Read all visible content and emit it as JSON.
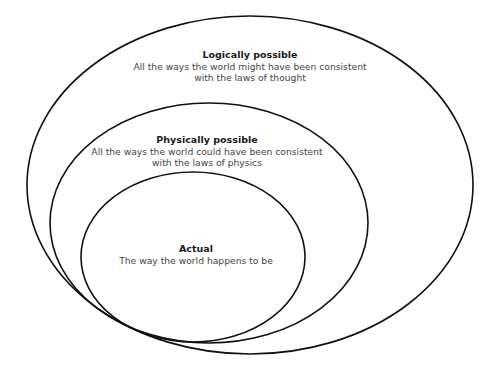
{
  "diagram": {
    "type": "nested-ellipses",
    "sets": [
      {
        "id": "logically-possible",
        "title": "Logically possible",
        "description_lines": [
          "All the ways the world might have been consistent",
          "with the laws of thought"
        ]
      },
      {
        "id": "physically-possible",
        "title": "Physically possible",
        "description_lines": [
          "All the ways the world could have been consistent",
          "with the laws of physics"
        ]
      },
      {
        "id": "actual",
        "title": "Actual",
        "description_lines": [
          "The way the world happens to be"
        ]
      }
    ],
    "colors": {
      "stroke": "#111111",
      "title": "#1a1a1a",
      "text": "#444444",
      "background": "#ffffff"
    }
  }
}
